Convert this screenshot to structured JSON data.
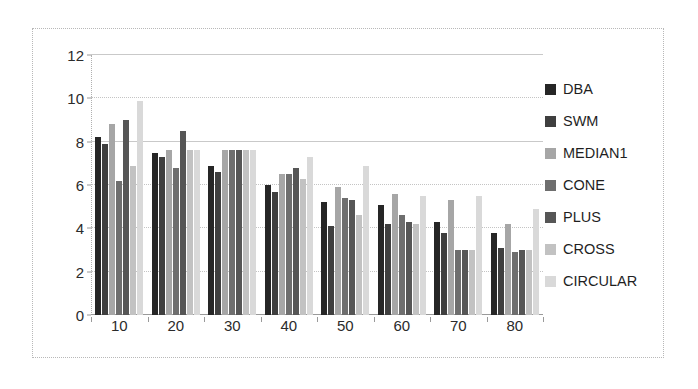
{
  "chart_data": {
    "type": "bar",
    "title": "",
    "xlabel": "",
    "ylabel": "",
    "categories": [
      "10",
      "20",
      "30",
      "40",
      "50",
      "60",
      "70",
      "80"
    ],
    "ylim": [
      0,
      12
    ],
    "yticks": [
      0,
      2,
      4,
      6,
      8,
      10,
      12
    ],
    "grid": true,
    "legend_position": "right",
    "series": [
      {
        "name": "DBA",
        "color": "#262626",
        "values": [
          8.2,
          7.5,
          6.9,
          6.0,
          5.2,
          5.1,
          4.3,
          3.8
        ]
      },
      {
        "name": "SWM",
        "color": "#3f3f3f",
        "values": [
          7.9,
          7.3,
          6.6,
          5.7,
          4.1,
          4.2,
          3.8,
          3.1
        ]
      },
      {
        "name": "MEDIAN1",
        "color": "#a6a6a6",
        "values": [
          8.8,
          7.6,
          7.6,
          6.5,
          5.9,
          5.6,
          5.3,
          4.2
        ]
      },
      {
        "name": "CONE",
        "color": "#6e6e6e",
        "values": [
          6.2,
          6.8,
          7.6,
          6.5,
          5.4,
          4.6,
          3.0,
          2.9
        ]
      },
      {
        "name": "PLUS",
        "color": "#565656",
        "values": [
          9.0,
          8.5,
          7.6,
          6.8,
          5.3,
          4.3,
          3.0,
          3.0
        ]
      },
      {
        "name": "CROSS",
        "color": "#c2c2c2",
        "values": [
          6.9,
          7.6,
          7.6,
          6.3,
          4.6,
          4.2,
          3.0,
          3.0
        ]
      },
      {
        "name": "CIRCULAR",
        "color": "#d9d9d9",
        "values": [
          9.9,
          7.6,
          7.6,
          7.3,
          6.9,
          5.5,
          5.5,
          4.9
        ]
      }
    ]
  },
  "legend": {
    "items": [
      {
        "label": "DBA",
        "color": "#262626"
      },
      {
        "label": "SWM",
        "color": "#3f3f3f"
      },
      {
        "label": "MEDIAN1",
        "color": "#a6a6a6"
      },
      {
        "label": "CONE",
        "color": "#6e6e6e"
      },
      {
        "label": "PLUS",
        "color": "#565656"
      },
      {
        "label": "CROSS",
        "color": "#c2c2c2"
      },
      {
        "label": "CIRCULAR",
        "color": "#d9d9d9"
      }
    ]
  }
}
